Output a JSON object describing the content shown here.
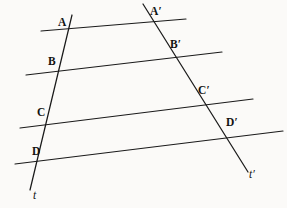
{
  "figure": {
    "type": "geometry-diagram",
    "background_color": "#fbfaf8",
    "stroke_color": "#1a1a1a",
    "width": 287,
    "height": 208
  },
  "labels": {
    "A": "A",
    "B": "B",
    "C": "C",
    "D": "D",
    "A_prime": "A′",
    "B_prime": "B′",
    "C_prime": "C′",
    "D_prime": "D′",
    "t": "t",
    "t_prime": "t′"
  },
  "geometry": {
    "transversals": [
      {
        "name": "t",
        "x1": 72,
        "y1": 15,
        "x2": 30,
        "y2": 190,
        "points": [
          "A",
          "B",
          "C",
          "D"
        ]
      },
      {
        "name": "t′",
        "x1": 143,
        "y1": 4,
        "x2": 248,
        "y2": 172,
        "points": [
          "A′",
          "B′",
          "C′",
          "D′"
        ]
      }
    ],
    "parallels": [
      {
        "id": "line-AA",
        "x1": 41,
        "y1": 31,
        "x2": 186,
        "y2": 19,
        "through": [
          "A",
          "A′"
        ]
      },
      {
        "id": "line-BB",
        "x1": 26,
        "y1": 75,
        "x2": 222,
        "y2": 52,
        "through": [
          "B",
          "B′"
        ]
      },
      {
        "id": "line-CC",
        "x1": 20,
        "y1": 128,
        "x2": 253,
        "y2": 99,
        "through": [
          "C",
          "C′"
        ]
      },
      {
        "id": "line-DD",
        "x1": 15,
        "y1": 164,
        "x2": 283,
        "y2": 131,
        "through": [
          "D",
          "D′"
        ]
      }
    ],
    "label_positions": {
      "A": {
        "x": 58,
        "y": 17
      },
      "B": {
        "x": 48,
        "y": 56
      },
      "C": {
        "x": 37,
        "y": 107
      },
      "D": {
        "x": 32,
        "y": 146
      },
      "A_prime": {
        "x": 150,
        "y": 6
      },
      "B_prime": {
        "x": 170,
        "y": 39
      },
      "C_prime": {
        "x": 198,
        "y": 85
      },
      "D_prime": {
        "x": 226,
        "y": 117
      },
      "t": {
        "x": 33,
        "y": 190
      },
      "t_prime": {
        "x": 249,
        "y": 169
      }
    }
  }
}
